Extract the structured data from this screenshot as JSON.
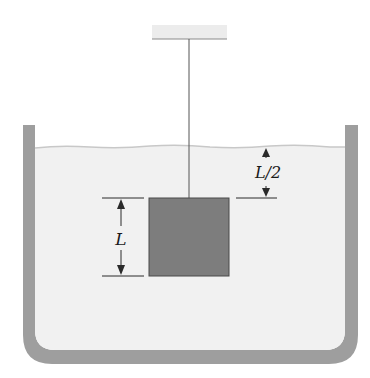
{
  "diagram": {
    "labels": {
      "side_length": "L",
      "depth": "L/2"
    },
    "colors": {
      "background": "#ffffff",
      "liquid": "#f1f1f1",
      "liquid_surface": "#c8c8c8",
      "container_wall": "#9e9e9e",
      "block_fill": "#7d7d7d",
      "block_edge": "#4a4a4a",
      "support": "#ececec",
      "line": "#2a2a2a"
    },
    "components": [
      "ceiling-support",
      "suspension-string",
      "block",
      "container",
      "liquid",
      "dimension-L",
      "dimension-L-over-2"
    ]
  }
}
